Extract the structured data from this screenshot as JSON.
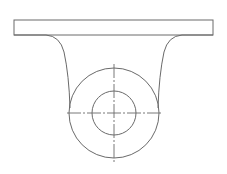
{
  "drawing": {
    "type": "technical-drawing",
    "subject": "bracket-with-boss",
    "stroke_color": "#6a6a6a",
    "background_color": "#ffffff",
    "base_plate": {
      "x": 14,
      "y": 20,
      "width": 199,
      "height": 15
    },
    "boss_center": {
      "cx": 114,
      "cy": 113
    },
    "outer_circle": {
      "r": 45
    },
    "inner_circle": {
      "r": 22
    },
    "horizontal_centerline": {
      "x1": 67,
      "x2": 162,
      "y": 113
    },
    "vertical_centerline": {
      "x": 114,
      "y1": 64,
      "y2": 163
    },
    "left_flank": "M 14 35 L 46 35 Q 60 36 64 52 Q 69 75 70 108",
    "right_flank": "M 213 35 L 182 35 Q 168 36 164 52 Q 159 75 158 108"
  }
}
